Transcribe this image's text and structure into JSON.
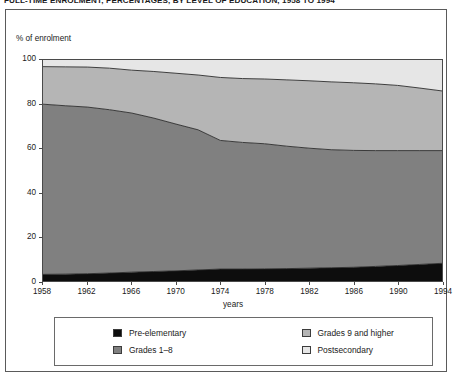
{
  "title": "FULL-TIME ENROLMENT, PERCENTAGES, BY LEVEL OF EDUCATION, 1958 TO 1994",
  "axes": {
    "ylabel": "% of enrolment",
    "xlabel": "years",
    "yticks": [
      "0",
      "20",
      "40",
      "60",
      "80",
      "100"
    ],
    "xticks": [
      "1958",
      "1962",
      "1966",
      "1970",
      "1974",
      "1978",
      "1982",
      "1986",
      "1990",
      "1994"
    ]
  },
  "legend": {
    "items": [
      {
        "label": "Pre-elementary",
        "color": "#0d0d0d"
      },
      {
        "label": "Grades 1–8",
        "color": "#808080"
      },
      {
        "label": "Grades 9 and higher",
        "color": "#b5b5b5"
      },
      {
        "label": "Postsecondary",
        "color": "#e6e6e6"
      }
    ]
  },
  "colors": {
    "pre_elementary": "#0d0d0d",
    "grades_1_8": "#808080",
    "grades_9_higher": "#b5b5b5",
    "postsecondary": "#e6e6e6",
    "axis": "#4a4a4a",
    "boundary": "#2b2b2b",
    "frame": "#5a5a5a",
    "text": "#1a1a1a"
  },
  "chart_data": {
    "type": "area",
    "stacked": true,
    "title": "FULL-TIME ENROLMENT, PERCENTAGES, BY LEVEL OF EDUCATION, 1958 TO 1994",
    "xlabel": "years",
    "ylabel": "% of enrolment",
    "xlim": [
      1958,
      1994
    ],
    "ylim": [
      0,
      100
    ],
    "grid": false,
    "legend_position": "bottom",
    "x": [
      1958,
      1960,
      1962,
      1964,
      1966,
      1968,
      1970,
      1972,
      1974,
      1976,
      1978,
      1980,
      1982,
      1984,
      1986,
      1988,
      1990,
      1992,
      1994
    ],
    "series": [
      {
        "name": "Pre-elementary",
        "color": "#0d0d0d",
        "values": [
          3.0,
          3.1,
          3.3,
          3.6,
          4.0,
          4.3,
          4.6,
          5.0,
          5.4,
          5.4,
          5.5,
          5.6,
          5.8,
          6.0,
          6.2,
          6.6,
          7.0,
          7.5,
          8.0
        ]
      },
      {
        "name": "Grades 1–8",
        "color": "#808080",
        "values": [
          77.0,
          76.2,
          75.4,
          73.9,
          72.0,
          69.4,
          66.4,
          63.4,
          58.2,
          57.3,
          56.6,
          55.4,
          54.3,
          53.4,
          52.9,
          52.4,
          52.0,
          51.5,
          51.0
        ]
      },
      {
        "name": "Grades 9 and higher",
        "color": "#b5b5b5",
        "values": [
          17.0,
          17.6,
          18.1,
          18.8,
          19.4,
          21.1,
          23.0,
          24.8,
          28.5,
          28.9,
          29.3,
          30.0,
          30.5,
          30.7,
          30.6,
          30.2,
          29.5,
          28.3,
          27.0
        ]
      },
      {
        "name": "Postsecondary",
        "color": "#e6e6e6",
        "values": [
          3.0,
          3.1,
          3.2,
          3.7,
          4.6,
          5.2,
          6.0,
          6.8,
          7.9,
          8.4,
          8.6,
          9.0,
          9.4,
          9.9,
          10.3,
          10.8,
          11.5,
          12.7,
          14.0
        ]
      }
    ],
    "cumulative_tops": {
      "pre_elementary": [
        3.0,
        3.1,
        3.3,
        3.6,
        4.0,
        4.3,
        4.6,
        5.0,
        5.4,
        5.4,
        5.5,
        5.6,
        5.8,
        6.0,
        6.2,
        6.6,
        7.0,
        7.5,
        8.0
      ],
      "grades_1_8": [
        80.0,
        79.3,
        78.7,
        77.5,
        76.0,
        73.7,
        71.0,
        68.4,
        63.6,
        62.7,
        62.1,
        61.0,
        60.1,
        59.4,
        59.1,
        59.0,
        59.0,
        59.0,
        59.0
      ],
      "grades_9_higher": [
        97.0,
        96.9,
        96.8,
        96.3,
        95.4,
        94.8,
        94.0,
        93.2,
        92.1,
        91.6,
        91.4,
        91.0,
        90.6,
        90.1,
        89.7,
        89.2,
        88.5,
        87.3,
        86.0
      ],
      "postsecondary": [
        100,
        100,
        100,
        100,
        100,
        100,
        100,
        100,
        100,
        100,
        100,
        100,
        100,
        100,
        100,
        100,
        100,
        100,
        100
      ]
    }
  }
}
